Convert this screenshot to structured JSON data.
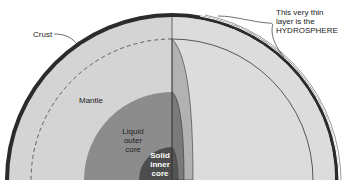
{
  "diagram": {
    "type": "earth-cross-section",
    "labels": {
      "crust": "Crust",
      "mantle": "Mantle",
      "outer_core": [
        "Liquid",
        "outer",
        "core"
      ],
      "inner_core": [
        "Solid",
        "inner",
        "core"
      ],
      "hydrosphere": [
        "This very thin",
        "layer is the",
        "HYDROSPHERE"
      ]
    },
    "colors": {
      "background": "#ffffff",
      "crust": "#2b2b2b",
      "mantle": "#d2d2d2",
      "mantle_right": "#dcdcdc",
      "outer_core": "#8a8a8a",
      "inner_core": "#4d4d4d",
      "cut_band": "#b4b4b4",
      "line": "#333333"
    }
  }
}
